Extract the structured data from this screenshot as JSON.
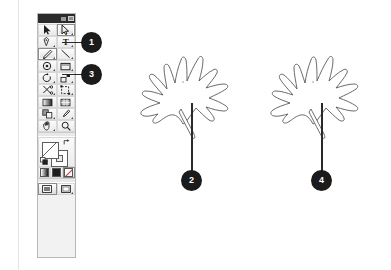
{
  "document": {
    "title": "Illustrator toolbox with two maple leaf drawings",
    "background_color": "#ffffff",
    "stroke_color": "#5a5a5a",
    "callout_color": "#1b1b1b"
  },
  "toolbox": {
    "panel_name": "Tools panel",
    "titlebar": {
      "grip_icon": "dots-grip-icon",
      "close_icon": "close-icon"
    },
    "rows": [
      {
        "cells": [
          {
            "label": "Selection Tool",
            "icon": "selection-arrow-icon",
            "selected": false,
            "has_flyout": false
          },
          {
            "label": "Direct Selection Tool",
            "icon": "direct-selection-arrow-icon",
            "selected": true,
            "has_flyout": true
          }
        ]
      },
      {
        "cells": [
          {
            "label": "Pen Tool",
            "icon": "pen-icon",
            "selected": false,
            "has_flyout": true
          },
          {
            "label": "Type Tool",
            "icon": "type-t-icon",
            "selected": false,
            "has_flyout": true
          }
        ]
      },
      {
        "cells": [
          {
            "label": "Pencil Tool",
            "icon": "pencil-icon",
            "selected": true,
            "has_flyout": true
          },
          {
            "label": "Line Segment Tool",
            "icon": "line-segment-icon",
            "selected": false,
            "has_flyout": true
          }
        ]
      },
      {
        "cells": [
          {
            "label": "Ellipse Tool",
            "icon": "ellipse-icon",
            "selected": false,
            "has_flyout": true
          },
          {
            "label": "Rectangle Tool",
            "icon": "rectangle-icon",
            "selected": false,
            "has_flyout": true
          }
        ]
      },
      {
        "cells": [
          {
            "label": "Rotate Tool",
            "icon": "rotate-icon",
            "selected": false,
            "has_flyout": true
          },
          {
            "label": "Scale Tool",
            "icon": "scale-icon",
            "selected": false,
            "has_flyout": true
          }
        ]
      },
      {
        "cells": [
          {
            "label": "Scissors Tool",
            "icon": "scissors-icon",
            "selected": false,
            "has_flyout": true
          },
          {
            "label": "Free Transform Tool",
            "icon": "free-transform-icon",
            "selected": false,
            "has_flyout": true
          }
        ]
      },
      {
        "cells": [
          {
            "label": "Gradient Tool",
            "icon": "gradient-icon",
            "selected": false,
            "has_flyout": false
          },
          {
            "label": "Mesh Tool",
            "icon": "mesh-icon",
            "selected": false,
            "has_flyout": false
          }
        ]
      },
      {
        "cells": [
          {
            "label": "Blend Tool",
            "icon": "blend-icon",
            "selected": false,
            "has_flyout": true
          },
          {
            "label": "Eyedropper Tool",
            "icon": "eyedropper-icon",
            "selected": false,
            "has_flyout": true
          }
        ]
      },
      {
        "cells": [
          {
            "label": "Hand Tool",
            "icon": "hand-icon",
            "selected": false,
            "has_flyout": true
          },
          {
            "label": "Zoom Tool",
            "icon": "magnifier-icon",
            "selected": false,
            "has_flyout": false
          }
        ]
      }
    ],
    "fill_stroke": {
      "label": "Fill and Stroke",
      "fill_name": "fill-swatch",
      "stroke_name": "stroke-swatch",
      "swap_icon": "swap-fill-stroke-icon",
      "default_icon": "default-fill-stroke-icon"
    },
    "paint_row": [
      {
        "label": "Gradient",
        "icon": "gradient-swatch-icon",
        "selected": false
      },
      {
        "label": "Color",
        "icon": "color-swatch-icon",
        "selected": false
      },
      {
        "label": "None",
        "icon": "none-swatch-icon",
        "selected": true
      }
    ],
    "screen_modes": [
      {
        "label": "Normal Screen Mode",
        "icon": "screen-normal-icon",
        "selected": true
      },
      {
        "label": "Full Screen Mode",
        "icon": "screen-full-icon",
        "selected": false
      }
    ]
  },
  "callouts": [
    {
      "number": "1",
      "target": "direct-selection-tool",
      "x": 82,
      "y": 33,
      "size": 19
    },
    {
      "number": "3",
      "target": "pencil-tool",
      "x": 82,
      "y": 65,
      "size": 19
    },
    {
      "number": "2",
      "target": "left-leaf-stem",
      "x": 179,
      "y": 171,
      "size": 19
    },
    {
      "number": "4",
      "target": "right-leaf-stem",
      "x": 309,
      "y": 171,
      "size": 19
    }
  ],
  "artwork": [
    {
      "name": "left-leaf",
      "label": "Maple leaf outline, left",
      "anchor_point_visible": true,
      "stem_label": "leaf stem"
    },
    {
      "name": "right-leaf",
      "label": "Maple leaf outline, right",
      "anchor_point_visible": true,
      "stem_label": "leaf stem"
    }
  ]
}
